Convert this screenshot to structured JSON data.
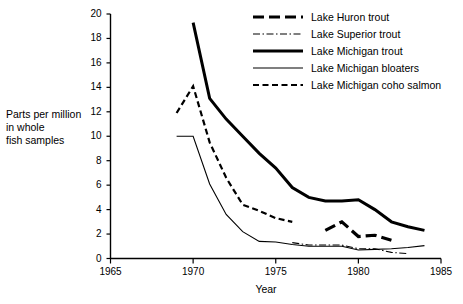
{
  "chart_data": {
    "type": "line",
    "title": "",
    "xlabel": "Year",
    "ylabel": "Parts per million in whole fish samples",
    "ylabel_lines": [
      "Parts per million",
      "in whole",
      "fish samples"
    ],
    "xlim": [
      1965,
      1985
    ],
    "ylim": [
      0,
      20
    ],
    "xticks": [
      1965,
      1970,
      1975,
      1980,
      1985
    ],
    "yticks": [
      0,
      2,
      4,
      6,
      8,
      10,
      12,
      14,
      16,
      18,
      20
    ],
    "grid": false,
    "legend_position": "top-right",
    "series": [
      {
        "name": "Lake Huron trout",
        "style": "thick-long-dash",
        "color": "#000000",
        "x": [
          1978,
          1979,
          1980,
          1981,
          1982
        ],
        "values": [
          2.3,
          3.0,
          1.8,
          1.9,
          1.5
        ]
      },
      {
        "name": "Lake Superior trout",
        "style": "thin-dash-dot",
        "color": "#000000",
        "x": [
          1976,
          1977,
          1978,
          1979,
          1980,
          1981,
          1982,
          1983
        ],
        "values": [
          1.3,
          1.1,
          1.1,
          1.1,
          0.8,
          0.8,
          0.5,
          0.4
        ]
      },
      {
        "name": "Lake Michigan trout",
        "style": "thick-solid",
        "color": "#000000",
        "x": [
          1970,
          1971,
          1972,
          1973,
          1974,
          1975,
          1976,
          1977,
          1978,
          1979,
          1980,
          1981,
          1982,
          1983,
          1984
        ],
        "values": [
          19.3,
          13.1,
          11.4,
          10.0,
          8.6,
          7.4,
          5.8,
          5.0,
          4.7,
          4.7,
          4.8,
          4.0,
          3.0,
          2.6,
          2.3
        ]
      },
      {
        "name": "Lake Michigan bloaters",
        "style": "thin-solid",
        "color": "#000000",
        "x": [
          1969,
          1970,
          1971,
          1972,
          1973,
          1974,
          1975,
          1976,
          1977,
          1978,
          1979,
          1980,
          1981,
          1982,
          1983,
          1984
        ],
        "values": [
          10.0,
          10.0,
          6.1,
          3.6,
          2.2,
          1.4,
          1.35,
          1.15,
          1.0,
          1.0,
          1.0,
          0.7,
          0.75,
          0.8,
          0.9,
          1.05
        ]
      },
      {
        "name": "Lake Michigan coho salmon",
        "style": "medium-dash",
        "color": "#000000",
        "x": [
          1969,
          1970,
          1971,
          1972,
          1973,
          1974,
          1975,
          1976
        ],
        "values": [
          11.9,
          14.1,
          9.5,
          6.6,
          4.4,
          3.9,
          3.3,
          3.0
        ]
      }
    ]
  },
  "axes": {
    "x_tick_labels": [
      "1965",
      "1970",
      "1975",
      "1980",
      "1985"
    ],
    "y_tick_labels": [
      "0",
      "2",
      "4",
      "6",
      "8",
      "10",
      "12",
      "14",
      "16",
      "18",
      "20"
    ],
    "x_axis_title": "Year",
    "y_axis_title_lines": [
      "Parts per million",
      "in whole",
      "fish samples"
    ]
  },
  "legend": {
    "items": [
      {
        "label": "Lake Huron trout",
        "style": "thick-long-dash"
      },
      {
        "label": "Lake Superior trout",
        "style": "thin-dash-dot"
      },
      {
        "label": "Lake Michigan trout",
        "style": "thick-solid"
      },
      {
        "label": "Lake Michigan bloaters",
        "style": "thin-solid"
      },
      {
        "label": "Lake Michigan coho salmon",
        "style": "medium-dash"
      }
    ]
  }
}
